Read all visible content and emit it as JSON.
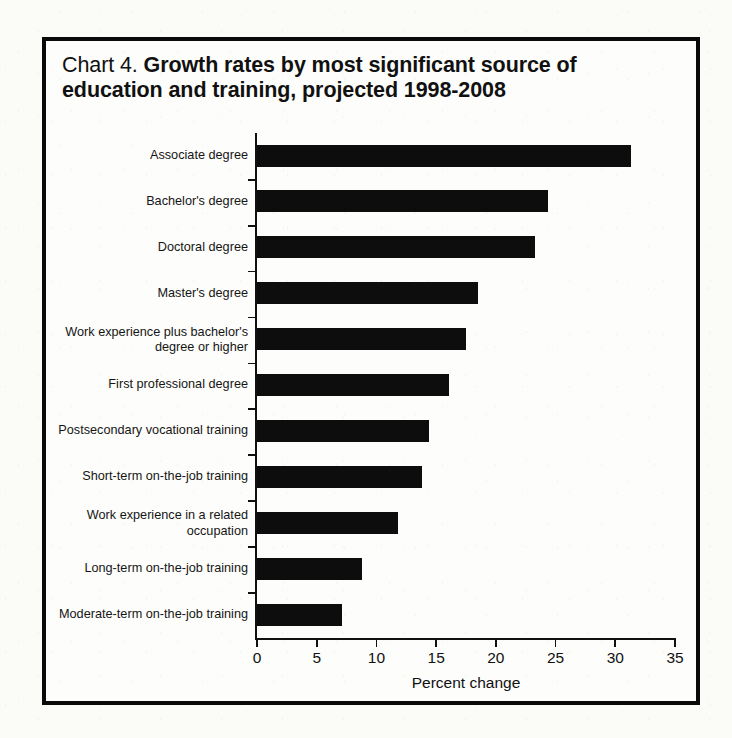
{
  "figure": {
    "label_prefix": "Chart 4.",
    "title_main": "Growth rates by most significant source of education and training, projected 1998-2008"
  },
  "chart_data": {
    "type": "bar",
    "orientation": "horizontal",
    "title": "Chart 4. Growth rates by most significant source of education and training, projected 1998-2008",
    "xlabel": "Percent change",
    "ylabel": "",
    "xlim": [
      0,
      35
    ],
    "xticks": [
      0,
      5,
      10,
      15,
      20,
      25,
      30,
      35
    ],
    "xticklabels": [
      "0",
      "5",
      "10",
      "15",
      "20",
      "25",
      "30",
      "35"
    ],
    "grid": false,
    "legend": false,
    "bar_color": "#0d0d0d",
    "categories": [
      "Associate degree",
      "Bachelor's degree",
      "Doctoral degree",
      "Master's degree",
      "Work experience plus bachelor's\ndegree or higher",
      "First professional degree",
      "Postsecondary vocational training",
      "Short-term on-the-job training",
      "Work experience in a related\noccupation",
      "Long-term on-the-job training",
      "Moderate-term on-the-job training"
    ],
    "values": [
      31.3,
      24.4,
      23.3,
      18.5,
      17.5,
      16.1,
      14.4,
      13.8,
      11.8,
      8.8,
      7.1
    ]
  }
}
